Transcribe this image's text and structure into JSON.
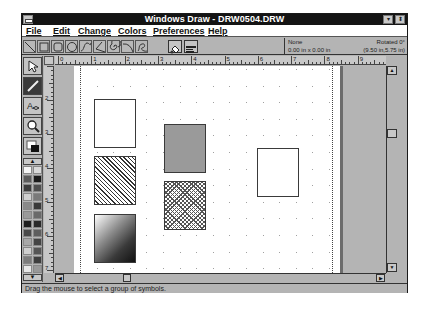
{
  "window": {
    "title": "Windows Draw - DRW0504.DRW",
    "minimize_glyph": "▾",
    "restore_glyph": "⬍"
  },
  "menu": {
    "items": [
      {
        "label": "File",
        "accel": "F"
      },
      {
        "label": "Edit",
        "accel": "E"
      },
      {
        "label": "Change",
        "accel": "C"
      },
      {
        "label": "Colors",
        "accel": "o"
      },
      {
        "label": "Preferences",
        "accel": "P"
      },
      {
        "label": "Help",
        "accel": "H"
      }
    ]
  },
  "toolbar": {
    "shape_tools": [
      "line",
      "rectangle",
      "rounded-rectangle",
      "ellipse",
      "curve",
      "polygon",
      "spiral",
      "arc",
      "freehand"
    ],
    "action_buttons": [
      "fill-bucket",
      "text-options"
    ]
  },
  "info_panel": {
    "selection": "None",
    "rotation": "Rotated 0°",
    "size": "0.00 in x 0.00 in",
    "position": "(9.50 in,5.75 in)"
  },
  "toolbox": {
    "tools": [
      "pointer",
      "draw",
      "text",
      "zoom",
      "color-fill"
    ],
    "palette_up": "▲",
    "palette_down": "▼",
    "palette_colors": [
      [
        "#f4f4f4",
        "#d8d8d8"
      ],
      [
        "#5a5a5a",
        "#1a1a1a"
      ],
      [
        "#3c3c3c",
        "#4e4e4e"
      ],
      [
        "#d0d0d0",
        "#7a7a7a"
      ],
      [
        "#8a8a8a",
        "#3a3a3a"
      ],
      [
        "#9a9a9a",
        "#6a6a6a"
      ],
      [
        "#1e1e1e",
        "#2a2a2a"
      ],
      [
        "#4a4a4a",
        "#5e5e5e"
      ],
      [
        "#a8a8a8",
        "#444444"
      ],
      [
        "#cfcfcf",
        "#555555"
      ],
      [
        "#7c7c7c",
        "#3e3e3e"
      ],
      [
        "#e8e8e8",
        "#999999"
      ]
    ]
  },
  "rulers": {
    "horizontal": [
      "0",
      "1",
      "2",
      "3",
      "4",
      "5",
      "6",
      "7",
      "8",
      "9"
    ],
    "vertical": [
      "2",
      "3",
      "4",
      "5",
      "6",
      "7"
    ]
  },
  "canvas": {
    "shapes": [
      {
        "name": "white-rectangle-1",
        "fill": "white",
        "x": 72,
        "y": 33,
        "w": 42,
        "h": 49
      },
      {
        "name": "gray-rectangle",
        "fill": "gray",
        "x": 142,
        "y": 58,
        "w": 42,
        "h": 49
      },
      {
        "name": "hatched-rectangle",
        "fill": "diagonal-hatch",
        "x": 72,
        "y": 90,
        "w": 42,
        "h": 49
      },
      {
        "name": "dotted-rectangle",
        "fill": "crosshatch-dots",
        "x": 142,
        "y": 115,
        "w": 42,
        "h": 49
      },
      {
        "name": "gradient-rectangle",
        "fill": "gradient",
        "x": 72,
        "y": 148,
        "w": 42,
        "h": 49
      },
      {
        "name": "white-rectangle-2",
        "fill": "white",
        "x": 235,
        "y": 82,
        "w": 42,
        "h": 49
      }
    ]
  },
  "scrollbars": {
    "up": "▲",
    "down": "▼",
    "left": "◀",
    "right": "▶"
  },
  "status": {
    "message": "Drag the mouse to select a group of symbols."
  }
}
